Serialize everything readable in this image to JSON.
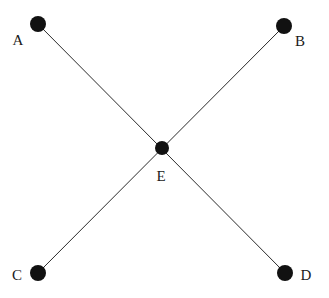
{
  "diagram": {
    "type": "node-link-graph",
    "shape": "X-crossing",
    "background_color": "#ffffff",
    "node_color": "#111111",
    "edge_color": "#2b2b2b",
    "label_color": "#1a1a1a",
    "width": 329,
    "height": 298,
    "nodes": [
      {
        "id": "A",
        "label": "A",
        "cx": 38,
        "cy": 24,
        "r": 8,
        "label_x": 18,
        "label_y": 40
      },
      {
        "id": "B",
        "label": "B",
        "cx": 284,
        "cy": 26,
        "r": 8,
        "label_x": 300,
        "label_y": 41
      },
      {
        "id": "E",
        "label": "E",
        "cx": 162,
        "cy": 148,
        "r": 7,
        "label_x": 161,
        "label_y": 176
      },
      {
        "id": "C",
        "label": "C",
        "cx": 38,
        "cy": 273,
        "r": 8,
        "label_x": 17,
        "label_y": 275
      },
      {
        "id": "D",
        "label": "D",
        "cx": 285,
        "cy": 273,
        "r": 8,
        "label_x": 306,
        "label_y": 275
      }
    ],
    "edges": [
      {
        "id": "A-D",
        "from": "A",
        "to": "D"
      },
      {
        "id": "B-C",
        "from": "B",
        "to": "C"
      }
    ],
    "edge_width": 1
  }
}
